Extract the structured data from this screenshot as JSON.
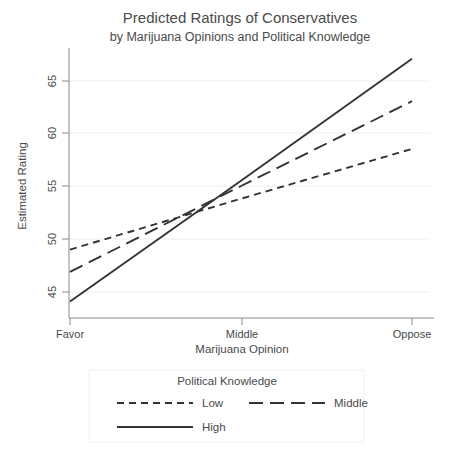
{
  "chart_data": {
    "type": "line",
    "title": "Predicted Ratings of Conservatives",
    "subtitle": "by Marijuana Opinions and Political Knowledge",
    "xlabel": "Marijuana Opinion",
    "ylabel": "Estimated Rating",
    "categories": [
      "Favor",
      "Middle",
      "Oppose"
    ],
    "x": [
      0,
      1,
      2
    ],
    "xlim": [
      0,
      2
    ],
    "ylim": [
      43.0,
      68.0
    ],
    "yticks": [
      45,
      50,
      55,
      60,
      65
    ],
    "ytick_labels": [
      "45",
      "50",
      "55",
      "60",
      "65"
    ],
    "xtick_labels": [
      "Favor",
      "Middle",
      "Oppose"
    ],
    "grid": "horizontal-faint",
    "legend_position": "below-center",
    "legend_title": "Political Knowledge",
    "series": [
      {
        "name": "Low",
        "values": [
          49.0,
          53.8,
          58.5
        ],
        "dash": "short-dash",
        "dasharray": "7,5"
      },
      {
        "name": "Middle",
        "values": [
          46.9,
          55.0,
          63.0
        ],
        "dash": "long-dash",
        "dasharray": "14,7"
      },
      {
        "name": "High",
        "values": [
          44.1,
          55.5,
          67.0
        ],
        "dash": "solid",
        "dasharray": "none"
      }
    ]
  },
  "legend": {
    "title": "Political Knowledge",
    "entries": [
      {
        "label": "Low"
      },
      {
        "label": "Middle"
      },
      {
        "label": "High"
      }
    ]
  },
  "colors": {
    "line": "#333333",
    "axis": "#8a8a8a",
    "grid": "#eeeeee",
    "text": "#4a4a4a",
    "background": "#ffffff"
  }
}
